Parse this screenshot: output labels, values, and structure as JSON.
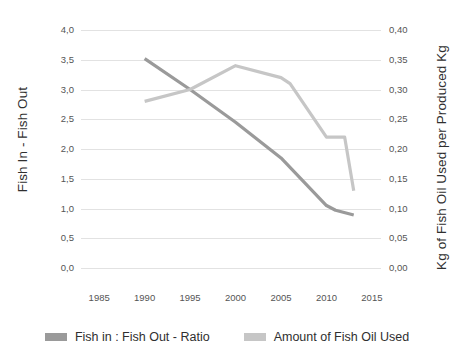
{
  "chart_data": {
    "type": "line",
    "title": "",
    "subtitle": "",
    "xlabel": "",
    "ylabel": "Fish In - Fish Out",
    "y2label": "Kg of Fish Oil Used per Produced Kg",
    "grid": true,
    "legend_position": "bottom",
    "xlim": [
      1983,
      2016
    ],
    "ylim": [
      0.0,
      4.0
    ],
    "y2lim": [
      0.0,
      0.4
    ],
    "x_ticks": [
      1985,
      1990,
      1995,
      2000,
      2005,
      2010,
      2015
    ],
    "x_tick_labels": [
      "1985",
      "1990",
      "1995",
      "2000",
      "2005",
      "2010",
      "2015"
    ],
    "y_ticks": [
      0.0,
      0.5,
      1.0,
      1.5,
      2.0,
      2.5,
      3.0,
      3.5,
      4.0
    ],
    "y_tick_labels": [
      "0,0",
      "0,5",
      "1,0",
      "1,5",
      "2,0",
      "2,5",
      "3,0",
      "3,5",
      "4,0"
    ],
    "y2_ticks": [
      0.0,
      0.05,
      0.1,
      0.15,
      0.2,
      0.25,
      0.3,
      0.35,
      0.4
    ],
    "y2_tick_labels": [
      "0,00",
      "0,05",
      "0,10",
      "0,15",
      "0,20",
      "0,25",
      "0,30",
      "0,35",
      "0,40"
    ],
    "series": [
      {
        "name": "Fish in : Fish Out - Ratio",
        "axis": "left",
        "color": "#9a9a9a",
        "x": [
          1990,
          1995,
          2000,
          2005,
          2010,
          2011,
          2013
        ],
        "values": [
          3.52,
          3.0,
          2.45,
          1.85,
          1.05,
          0.97,
          0.89
        ]
      },
      {
        "name": "Amount of Fish Oil Used",
        "axis": "right",
        "color": "#c6c6c6",
        "x": [
          1990,
          1995,
          2000,
          2005,
          2006,
          2010,
          2012,
          2013
        ],
        "values": [
          0.28,
          0.3,
          0.34,
          0.32,
          0.31,
          0.22,
          0.22,
          0.13
        ]
      }
    ]
  },
  "legend": {
    "items": [
      {
        "label": "Fish in : Fish Out - Ratio",
        "color": "#9a9a9a"
      },
      {
        "label": "Amount of Fish Oil Used",
        "color": "#c6c6c6"
      }
    ]
  }
}
